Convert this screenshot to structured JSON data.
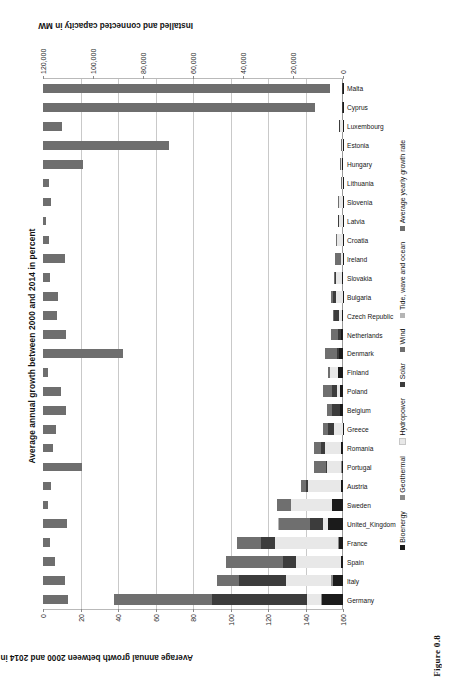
{
  "figure": {
    "caption": "Figure 0.8",
    "orientation": "rotated-90-ccw"
  },
  "chart_data": {
    "type": "bar",
    "title": "Average annual growth between 2000 and 2014 in percent",
    "xlabel": "",
    "ylabel": "Average annual growth between 2000 and 2014 in percent",
    "y2label": "Installed and connected capacity in MW",
    "grid": true,
    "legend_position": "bottom",
    "ylim": [
      0,
      160
    ],
    "y2lim": [
      0,
      120000
    ],
    "yticks": [
      "0",
      "20",
      "40",
      "60",
      "80",
      "100",
      "120",
      "140",
      "160"
    ],
    "y2ticks": [
      "0",
      "20,000",
      "40,000",
      "60,000",
      "80,000",
      "100,000",
      "120,000"
    ],
    "categories": [
      "Germany",
      "Italy",
      "Spain",
      "France",
      "United_Kingdom",
      "Sweden",
      "Austria",
      "Portugal",
      "Romania",
      "Greece",
      "Belgium",
      "Poland",
      "Finland",
      "Denmark",
      "Netherlands",
      "Czech Republic",
      "Bulgaria",
      "Slovakia",
      "Ireland",
      "Croatia",
      "Latvia",
      "Slovenia",
      "Lithuania",
      "Hungary",
      "Estonia",
      "Luxembourg",
      "Cyprus",
      "Malta"
    ],
    "series": [
      {
        "name": "Bioenergy",
        "axis": "right",
        "color": "#1b1b1b",
        "values": [
          8500,
          4100,
          1000,
          1700,
          6200,
          4300,
          800,
          600,
          800,
          50,
          1200,
          1300,
          2000,
          1500,
          700,
          400,
          70,
          220,
          90,
          80,
          60,
          120,
          60,
          600,
          150,
          40,
          10,
          5
        ]
      },
      {
        "name": "Geothermal",
        "axis": "right",
        "color": "#8a8a8a",
        "values": [
          40,
          900,
          0,
          17,
          0,
          0,
          1,
          30,
          0,
          0,
          0,
          0,
          0,
          0,
          0,
          0,
          0,
          0,
          0,
          0,
          0,
          0,
          0,
          0,
          0,
          0,
          0,
          0
        ]
      },
      {
        "name": "Hydropower",
        "axis": "right",
        "color": "#e8e8e8",
        "values": [
          5600,
          18000,
          17700,
          25400,
          1700,
          16400,
          13100,
          5500,
          6600,
          3400,
          120,
          970,
          3200,
          9,
          37,
          1090,
          2700,
          2500,
          530,
          2100,
          1580,
          1300,
          120,
          57,
          8,
          1100,
          0,
          0
        ]
      },
      {
        "name": "Solar",
        "axis": "right",
        "color": "#3c3c3c",
        "values": [
          38200,
          18600,
          5400,
          5700,
          5500,
          60,
          790,
          420,
          1300,
          2600,
          3130,
          2100,
          11,
          600,
          1100,
          2100,
          1030,
          530,
          1,
          33,
          1,
          250,
          68,
          35,
          0,
          110,
          65,
          54
        ]
      },
      {
        "name": "Wind",
        "axis": "right",
        "color": "#6f6f6f",
        "values": [
          39200,
          8660,
          22900,
          9300,
          12400,
          5420,
          2100,
          4900,
          2950,
          1980,
          1960,
          3830,
          620,
          4880,
          2800,
          280,
          690,
          3,
          2270,
          420,
          62,
          3,
          280,
          330,
          300,
          58,
          150,
          0
        ]
      },
      {
        "name": "Tide, wave and ocean",
        "axis": "right",
        "color": "#b5b5b5",
        "values": [
          0,
          0,
          0,
          240,
          9,
          0,
          0,
          0,
          0,
          0,
          0,
          0,
          0,
          0,
          0,
          0,
          0,
          0,
          0,
          0,
          0,
          0,
          0,
          0,
          0,
          0,
          0,
          0
        ]
      },
      {
        "name": "Average yearly growth rate",
        "axis": "left",
        "color": "#6e6e6e",
        "values": [
          13.5,
          11.5,
          6.5,
          3.5,
          13.0,
          2.5,
          4.0,
          21.0,
          5.5,
          7.0,
          12.5,
          9.5,
          2.5,
          42.5,
          12.5,
          7.5,
          8.0,
          3.5,
          11.5,
          3.0,
          1.5,
          4.5,
          3.0,
          21.5,
          67.0,
          10.0,
          145.0,
          153.0
        ]
      }
    ],
    "legend": [
      {
        "label": "Bioenergy",
        "color": "#1b1b1b"
      },
      {
        "label": "Geothermal",
        "color": "#8a8a8a"
      },
      {
        "label": "Hydropower",
        "color": "#e8e8e8"
      },
      {
        "label": "Solar",
        "color": "#3c3c3c"
      },
      {
        "label": "Wind",
        "color": "#6f6f6f"
      },
      {
        "label": "Tide, wave and ocean",
        "color": "#b5b5b5"
      },
      {
        "label": "Average yearly growth rate",
        "color": "#6e6e6e"
      }
    ]
  }
}
